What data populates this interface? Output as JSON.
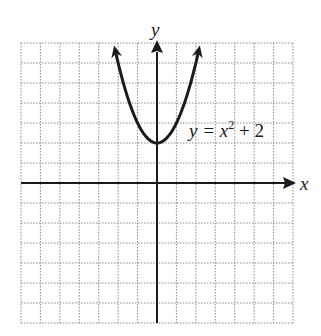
{
  "chart_data": {
    "type": "line",
    "title": "",
    "equation": "y = x^2 + 2",
    "equation_parts": {
      "lhs": "y = x",
      "exp": "2",
      "rhs": " + 2"
    },
    "xlabel": "x",
    "ylabel": "y",
    "xlim": [
      -7,
      7
    ],
    "ylim": [
      -7,
      7
    ],
    "grid": true,
    "grid_style": "dotted",
    "series": [
      {
        "name": "y = x^2 + 2",
        "x": [
          -2.24,
          -2,
          -1.5,
          -1,
          -0.5,
          0,
          0.5,
          1,
          1.5,
          2,
          2.24
        ],
        "y": [
          7,
          6,
          4.25,
          3,
          2.25,
          2,
          2.25,
          3,
          4.25,
          6,
          7
        ]
      }
    ],
    "vertex": [
      0,
      2
    ],
    "colors": {
      "curve": "#1a1a1a",
      "axes": "#1a1a1a",
      "grid": "#8a8a8a"
    }
  }
}
